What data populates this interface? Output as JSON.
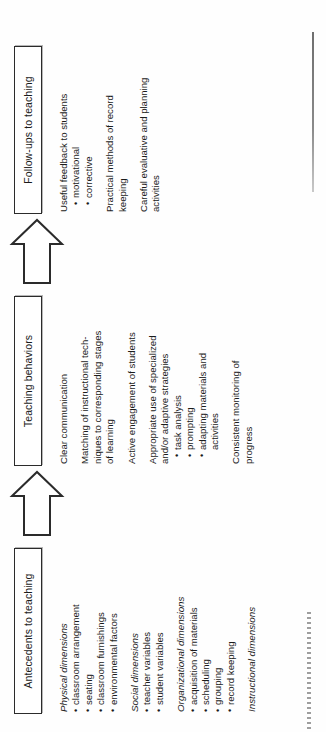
{
  "diagram": {
    "type": "horizontal-flowchart",
    "orientation": "rotated-90-ccw",
    "line_color": "#2b2b2b",
    "text_color": "#1b1b1b",
    "background": "#ffffff",
    "stages": [
      {
        "id": "antecedents",
        "header": "Antecedents to teaching",
        "groups": [
          {
            "title": "Physical dimensions",
            "italic": true,
            "items": [
              "classroom arrangement",
              "seating",
              "classroom furnishings",
              "environmental factors"
            ]
          },
          {
            "title": "Social dimensions",
            "italic": true,
            "items": [
              "teacher variables",
              "student variables"
            ]
          },
          {
            "title": "Organizational dimensions",
            "italic": true,
            "items": [
              "acquisition of materials",
              "scheduling",
              "grouping",
              "record keeping"
            ]
          },
          {
            "title": "Instructional dimensions",
            "italic": true,
            "items": []
          }
        ]
      },
      {
        "id": "teaching-behaviors",
        "header": "Teaching behaviors",
        "groups": [
          {
            "title": "Clear communication",
            "italic": false,
            "items": []
          },
          {
            "title": "Matching of instructional tech-\nniques to corresponding stages\nof learning",
            "italic": false,
            "items": []
          },
          {
            "title": "Active engagement of students",
            "italic": false,
            "items": []
          },
          {
            "title": "Appropriate use of specialized\nand/or adaptive strategies",
            "italic": false,
            "items": [
              "task analysis",
              "prompting",
              "adapting materials and\nactivities"
            ]
          },
          {
            "title": "Consistent monitoring of\nprogress",
            "italic": false,
            "items": []
          }
        ]
      },
      {
        "id": "follow-ups",
        "header": "Follow-ups to teaching",
        "groups": [
          {
            "title": "Useful feedback to students",
            "italic": false,
            "items": [
              "motivational",
              "corrective"
            ]
          },
          {
            "title": "Practical methods of record\nkeeping",
            "italic": false,
            "items": []
          },
          {
            "title": "Careful evaluative and planning\nactivities",
            "italic": false,
            "items": []
          }
        ]
      }
    ],
    "arrows": [
      {
        "id": "arrow-antecedents-to-behaviors",
        "direction": "right",
        "style": "hollow-block"
      },
      {
        "id": "arrow-behaviors-to-followups",
        "direction": "right",
        "style": "hollow-block"
      }
    ]
  }
}
